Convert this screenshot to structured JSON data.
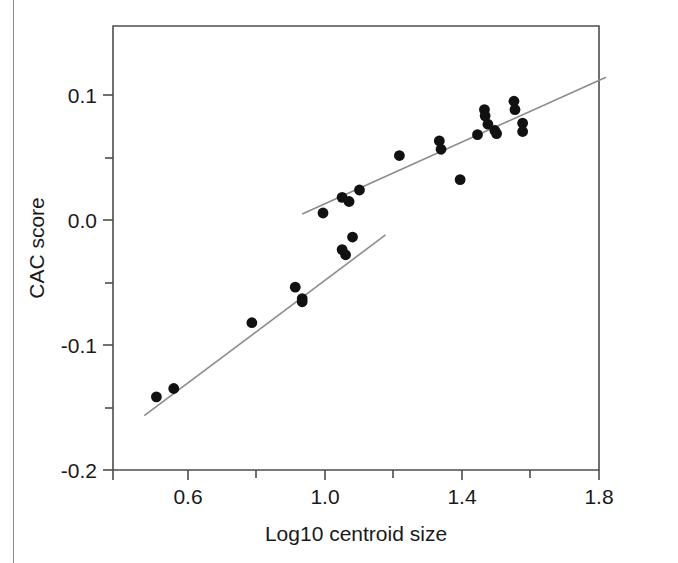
{
  "figure": {
    "background_color": "#ffffff",
    "frame_color": "#4d4d4d",
    "point_color": "#111111",
    "line_color": "#8c8c8c",
    "border_color": "#8a8a8a"
  },
  "chart_data": {
    "type": "scatter",
    "title": "",
    "xlabel": "Log10 centroid size",
    "ylabel": "CAC score",
    "xlim": [
      0.4,
      1.8
    ],
    "ylim": [
      -0.2,
      0.14
    ],
    "grid": false,
    "legend": null,
    "x_ticks_major": [
      "0.6",
      "1.0",
      "1.4",
      "1.8"
    ],
    "x_tick_values_major": [
      0.6,
      1.0,
      1.4,
      1.8
    ],
    "x_tick_values_minor": [
      0.8,
      1.2,
      1.6
    ],
    "y_ticks_major": [
      "0.1",
      "0.0",
      "-0.1",
      "-0.2"
    ],
    "y_tick_values_major": [
      0.1,
      0.0,
      -0.1,
      -0.2
    ],
    "y_tick_values_minor": [
      0.05,
      -0.05,
      -0.15
    ],
    "series": [
      {
        "name": "CAC vs Log10 centroid size",
        "marker": "filled-circle",
        "points": [
          [
            0.525,
            -0.144
          ],
          [
            0.575,
            -0.1376
          ],
          [
            0.8,
            -0.0872
          ],
          [
            0.925,
            -0.06
          ],
          [
            0.945,
            -0.0688
          ],
          [
            0.945,
            -0.0712
          ],
          [
            1.005,
            -0.0032
          ],
          [
            1.06,
            0.0088
          ],
          [
            1.08,
            0.0056
          ],
          [
            1.11,
            0.0144
          ],
          [
            1.09,
            -0.0216
          ],
          [
            1.06,
            -0.0312
          ],
          [
            1.07,
            -0.0352
          ],
          [
            1.225,
            0.0408
          ],
          [
            1.34,
            0.052
          ],
          [
            1.345,
            0.0456
          ],
          [
            1.4,
            0.0224
          ],
          [
            1.45,
            0.0568
          ],
          [
            1.47,
            0.076
          ],
          [
            1.472,
            0.0712
          ],
          [
            1.48,
            0.0648
          ],
          [
            1.5,
            0.06
          ],
          [
            1.505,
            0.0576
          ],
          [
            1.555,
            0.0824
          ],
          [
            1.558,
            0.076
          ],
          [
            1.58,
            0.0656
          ],
          [
            1.58,
            0.0592
          ]
        ]
      }
    ],
    "fit_lines": [
      {
        "name": "lower-segment-fit",
        "x": [
          0.49,
          1.185
        ],
        "y": [
          -0.1584,
          -0.02
        ]
      },
      {
        "name": "upper-segment-fit",
        "x": [
          0.945,
          1.82
        ],
        "y": [
          -0.004,
          0.1008
        ]
      }
    ]
  }
}
